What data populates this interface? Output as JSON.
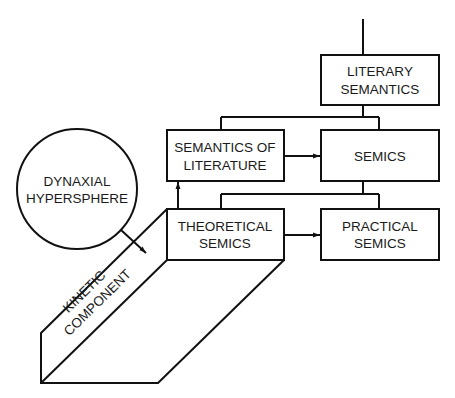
{
  "diagram": {
    "nodes": {
      "literary_semantics": {
        "line1": "LITERARY",
        "line2": "SEMANTICS"
      },
      "semantics_of_literature": {
        "line1": "SEMANTICS OF",
        "line2": "LITERATURE"
      },
      "semics": {
        "line1": "SEMICS"
      },
      "theoretical_semics": {
        "line1": "THEORETICAL",
        "line2": "SEMICS"
      },
      "practical_semics": {
        "line1": "PRACTICAL",
        "line2": "SEMICS"
      },
      "dynaxial_hypersphere": {
        "line1": "DYNAXIAL",
        "line2": "HYPERSPHERE"
      },
      "kinetic_component": {
        "line1": "KINETIC",
        "line2": "COMPONENT"
      }
    },
    "edges": [
      {
        "from": "top",
        "to": "literary_semantics",
        "type": "line"
      },
      {
        "from": "literary_semantics",
        "to": "semantics_of_literature",
        "type": "tree"
      },
      {
        "from": "literary_semantics",
        "to": "semics",
        "type": "tree"
      },
      {
        "from": "semantics_of_literature",
        "to": "semics",
        "type": "arrow"
      },
      {
        "from": "semics",
        "to": "theoretical_semics",
        "type": "tree"
      },
      {
        "from": "semics",
        "to": "practical_semics",
        "type": "tree"
      },
      {
        "from": "theoretical_semics",
        "to": "practical_semics",
        "type": "arrow"
      },
      {
        "from": "theoretical_semics",
        "to": "semantics_of_literature",
        "type": "arrow"
      },
      {
        "from": "dynaxial_hypersphere",
        "to": "kinetic_component",
        "type": "arrow"
      }
    ]
  }
}
